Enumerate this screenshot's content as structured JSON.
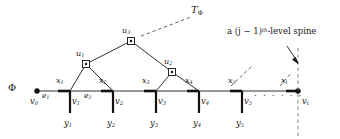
{
  "figure": {
    "type": "graph-diagram",
    "width": 340,
    "height": 139,
    "background": "#ffffff",
    "ink": "#1a1a1a"
  },
  "labels": {
    "tree_root_label": "T",
    "tree_root_sub": "Φ",
    "phi": "Φ",
    "annotation_prefix": "a (j − 1)",
    "annotation_sup": "th",
    "annotation_suffix": "-level spine",
    "ellipsis": "· · · · · ·"
  },
  "baseline": {
    "y": 91,
    "x_start": 36,
    "x_end": 298,
    "origin_node": {
      "name": "v0",
      "label": "v",
      "sub": "0",
      "cx": 37,
      "cy": 91
    },
    "terminal_node": {
      "name": "vt",
      "label": "v",
      "sub": "t",
      "cx": 298,
      "cy": 91
    }
  },
  "spine_vertices": [
    {
      "id": "v1",
      "label": "v",
      "sub": "1",
      "cx": 70,
      "cy": 91,
      "leaf": "y",
      "leaf_sub": "1",
      "leaf_y": 124
    },
    {
      "id": "v2",
      "label": "v",
      "sub": "2",
      "cx": 113,
      "cy": 91,
      "leaf": "y",
      "leaf_sub": "2",
      "leaf_y": 124
    },
    {
      "id": "v3",
      "label": "v",
      "sub": "3",
      "cx": 156,
      "cy": 91,
      "leaf": "y",
      "leaf_sub": "3",
      "leaf_y": 124
    },
    {
      "id": "v4",
      "label": "v",
      "sub": "4",
      "cx": 199,
      "cy": 91,
      "leaf": "y",
      "leaf_sub": "4",
      "leaf_y": 124
    },
    {
      "id": "v5",
      "label": "v",
      "sub": "5",
      "cx": 242,
      "cy": 91,
      "leaf": "y",
      "leaf_sub": "5",
      "leaf_y": 124
    }
  ],
  "thick_segments": [
    {
      "id": "x1",
      "label": "x",
      "sub": "1",
      "x1": 58,
      "x2": 70,
      "lx": 58,
      "ly": 79
    },
    {
      "id": "x2",
      "label": "x",
      "sub": "2",
      "x1": 101,
      "x2": 113,
      "lx": 101,
      "ly": 79
    },
    {
      "id": "x3",
      "label": "x",
      "sub": "3",
      "x1": 144,
      "x2": 156,
      "lx": 144,
      "ly": 79
    },
    {
      "id": "x4",
      "label": "x",
      "sub": "4",
      "x1": 187,
      "x2": 199,
      "lx": 187,
      "ly": 79
    },
    {
      "id": "x5",
      "label": "x",
      "sub": "5",
      "x1": 230,
      "x2": 242,
      "lx": 230,
      "ly": 79
    },
    {
      "id": "xt",
      "label": "x",
      "sub": "t",
      "x1": 286,
      "x2": 298,
      "lx": 283,
      "ly": 79
    }
  ],
  "edges": [
    {
      "id": "e1",
      "label": "e",
      "sub": "1",
      "lx": 43,
      "ly": 96
    },
    {
      "id": "e2",
      "label": "e",
      "sub": "2",
      "lx": 84,
      "ly": 96
    }
  ],
  "tree_nodes": [
    {
      "id": "u1",
      "label": "u",
      "sub": "1",
      "cx": 86,
      "cy": 64,
      "lx": 78,
      "ly": 52
    },
    {
      "id": "u2",
      "label": "u",
      "sub": "2",
      "cx": 172,
      "cy": 72,
      "lx": 165,
      "ly": 59
    },
    {
      "id": "u3",
      "label": "u",
      "sub": "3",
      "cx": 131,
      "cy": 41,
      "lx": 123,
      "ly": 29
    }
  ],
  "tree_edges": [
    {
      "from": "v1",
      "to": "u1"
    },
    {
      "from": "v2",
      "to": "u1"
    },
    {
      "from": "v3",
      "to": "u2"
    },
    {
      "from": "v4",
      "to": "u2"
    },
    {
      "from": "u1",
      "to": "u3"
    },
    {
      "from": "u2",
      "to": "u3"
    }
  ],
  "dashed_pointers": [
    {
      "name": "tree-label-pointer",
      "x1": 141,
      "y1": 36,
      "x2": 191,
      "y2": 17
    },
    {
      "name": "spine-pointer-left",
      "x1": 231,
      "y1": 86,
      "x2": 250,
      "y2": 68
    },
    {
      "name": "spine-pointer-right",
      "x1": 281,
      "y1": 86,
      "x2": 292,
      "y2": 73
    }
  ],
  "vertical_dashed_line": {
    "x": 298,
    "y1": 48,
    "y2": 137
  },
  "arrow": {
    "x1": 288,
    "y1": 47,
    "x2": 298,
    "y2": 62
  },
  "positions": {
    "phi": {
      "x": 10,
      "y": 85
    },
    "tree_label": {
      "x": 193,
      "y": 6
    },
    "annotation": {
      "x": 229,
      "y": 28
    },
    "ellipsis": {
      "x": 254,
      "y": 96
    },
    "v0_label": {
      "x": 31,
      "y": 98
    },
    "vt_label": {
      "x": 302,
      "y": 97
    }
  }
}
